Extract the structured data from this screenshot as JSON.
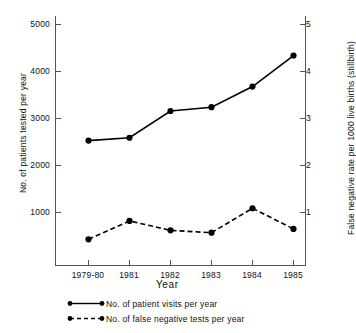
{
  "chart_data": {
    "type": "line",
    "title": "",
    "xlabel": "Year",
    "ylabel": "No. of patients tested per year",
    "y2label": "False negative rate per 1000 live births (stillbirth)",
    "categories": [
      "1979-80",
      "1981",
      "1982",
      "1983",
      "1984",
      "1985"
    ],
    "xtick_labels": [
      "1979-80",
      "1981",
      "1982",
      "1983",
      "1984",
      "1985"
    ],
    "ytick_labels": [
      "1000",
      "2000",
      "3000",
      "4000",
      "5000"
    ],
    "ytick_values": [
      1000,
      2000,
      3000,
      4000,
      5000
    ],
    "y2tick_labels": [
      "1",
      "2",
      "3",
      "4",
      "5"
    ],
    "y2tick_values": [
      1,
      2,
      3,
      4,
      5
    ],
    "ylim": [
      0,
      5300
    ],
    "y2lim": [
      0,
      5.3
    ],
    "grid": false,
    "legend_position": "below-axes",
    "series": [
      {
        "name": "No. of patient visits per year",
        "axis": "left",
        "style": "solid",
        "marker": "filled-circle",
        "color": "#000000",
        "values": [
          2530,
          2590,
          3160,
          3240,
          3680,
          4340
        ]
      },
      {
        "name": "No. of false negative tests per year",
        "axis": "left",
        "style": "dashed",
        "marker": "filled-circle",
        "color": "#000000",
        "values": [
          430,
          820,
          620,
          570,
          1090,
          650
        ],
        "right_axis_equivalent": [
          0.43,
          0.82,
          0.62,
          0.57,
          1.09,
          0.65
        ]
      }
    ],
    "legend": [
      {
        "label": "No. of patient visits per year",
        "style": "solid"
      },
      {
        "label": "No. of false negative tests per year",
        "style": "dashed"
      }
    ]
  },
  "axes": {
    "left_title": "No. of patients tested per year",
    "right_title": "False negative rate per 1000 live births (stillbirth)",
    "x_title": "Year"
  },
  "ticks": {
    "left": [
      "5000",
      "4000",
      "3000",
      "2000",
      "1000"
    ],
    "right": [
      "5",
      "4",
      "3",
      "2",
      "1"
    ],
    "x": [
      "1979-80",
      "1981",
      "1982",
      "1983",
      "1984",
      "1985"
    ]
  },
  "legend": {
    "solid_label": "No. of patient visits per year",
    "dashed_label": "No. of false negative tests per year"
  },
  "colors": {
    "ink": "#000000",
    "background": "#ffffff",
    "axis": "#555555"
  }
}
